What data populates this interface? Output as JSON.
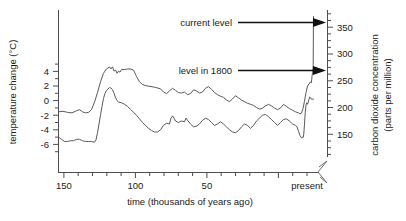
{
  "chart_data": {
    "type": "line",
    "title": "",
    "xlabel": "time (thousands of years ago)",
    "ylabel_left": "temperature change (°C)",
    "ylabel_right_line1": "carbon dioxide concentration",
    "ylabel_right_line2": "(parts per million)",
    "x_axis": {
      "tick_labels": [
        "150",
        "100",
        "50",
        "present"
      ],
      "tick_values": [
        150,
        100,
        50,
        0
      ],
      "minor_tick_values": [
        160,
        140,
        130,
        120,
        110,
        90,
        80,
        70,
        60,
        40,
        30,
        20,
        10
      ],
      "range": [
        170,
        -4
      ],
      "direction": "reversed",
      "units": "thousands of years ago"
    },
    "y_axis_left": {
      "tick_labels": [
        "4",
        "2",
        "0",
        "-2",
        "-4",
        "-6"
      ],
      "tick_values": [
        4,
        2,
        0,
        -2,
        -4,
        -6
      ],
      "minor_tick_values": [
        5,
        3,
        1,
        -1,
        -3,
        -5,
        -7
      ],
      "range": [
        -7.2,
        6.2
      ],
      "units": "°C"
    },
    "y_axis_right": {
      "tick_labels": [
        "350",
        "300",
        "250",
        "200",
        "150"
      ],
      "tick_values": [
        350,
        300,
        250,
        200,
        150
      ],
      "range": [
        120,
        380
      ],
      "units": "parts per million",
      "axis_break": true
    },
    "grid": false,
    "legend_position": "none",
    "annotations": [
      {
        "id": "current-level",
        "text": "current level",
        "points_to": "co2-curve-right-end",
        "value_ppm": 370
      },
      {
        "id": "level-1800",
        "text": "level in 1800",
        "points_to": "co2-curve-preindustrial",
        "value_ppm": 280
      }
    ],
    "series": [
      {
        "name": "carbon dioxide concentration",
        "axis": "right",
        "units": "ppm",
        "points": [
          [
            170,
            192
          ],
          [
            167,
            193
          ],
          [
            164,
            191
          ],
          [
            161,
            190
          ],
          [
            158,
            194
          ],
          [
            156,
            196
          ],
          [
            154,
            192
          ],
          [
            152,
            190
          ],
          [
            150,
            191
          ],
          [
            148,
            196
          ],
          [
            146,
            210
          ],
          [
            144,
            228
          ],
          [
            142,
            248
          ],
          [
            140,
            264
          ],
          [
            138,
            272
          ],
          [
            136,
            276
          ],
          [
            135,
            272
          ],
          [
            134,
            276
          ],
          [
            133,
            268
          ],
          [
            132,
            270
          ],
          [
            131,
            264
          ],
          [
            130,
            268
          ],
          [
            129,
            266
          ],
          [
            128,
            271
          ],
          [
            126,
            271
          ],
          [
            124,
            272
          ],
          [
            122,
            272
          ],
          [
            120,
            270
          ],
          [
            118,
            258
          ],
          [
            116,
            248
          ],
          [
            114,
            243
          ],
          [
            112,
            241
          ],
          [
            110,
            240
          ],
          [
            106,
            238
          ],
          [
            102,
            235
          ],
          [
            100,
            229
          ],
          [
            98,
            226
          ],
          [
            96,
            231
          ],
          [
            94,
            236
          ],
          [
            92,
            232
          ],
          [
            90,
            228
          ],
          [
            88,
            227
          ],
          [
            86,
            229
          ],
          [
            84,
            224
          ],
          [
            82,
            226
          ],
          [
            80,
            233
          ],
          [
            78,
            231
          ],
          [
            76,
            227
          ],
          [
            74,
            229
          ],
          [
            72,
            236
          ],
          [
            70,
            239
          ],
          [
            68,
            234
          ],
          [
            66,
            228
          ],
          [
            64,
            224
          ],
          [
            62,
            221
          ],
          [
            60,
            219
          ],
          [
            58,
            214
          ],
          [
            56,
            211
          ],
          [
            54,
            216
          ],
          [
            52,
            222
          ],
          [
            50,
            218
          ],
          [
            48,
            214
          ],
          [
            46,
            211
          ],
          [
            44,
            208
          ],
          [
            42,
            206
          ],
          [
            40,
            204
          ],
          [
            38,
            200
          ],
          [
            36,
            197
          ],
          [
            34,
            199
          ],
          [
            32,
            203
          ],
          [
            30,
            206
          ],
          [
            28,
            203
          ],
          [
            26,
            199
          ],
          [
            24,
            196
          ],
          [
            22,
            199
          ],
          [
            20,
            206
          ],
          [
            18,
            202
          ],
          [
            16,
            198
          ],
          [
            14,
            195
          ],
          [
            12,
            192
          ],
          [
            10,
            190
          ],
          [
            9,
            188
          ],
          [
            8,
            190
          ],
          [
            7,
            198
          ],
          [
            6,
            212
          ],
          [
            5,
            228
          ],
          [
            4,
            240
          ],
          [
            3,
            244
          ],
          [
            2,
            248
          ],
          [
            1.5,
            246
          ],
          [
            1.2,
            252
          ],
          [
            1.0,
            258
          ],
          [
            0.6,
            266
          ],
          [
            0.3,
            274
          ],
          [
            0.2,
            280
          ],
          [
            0.15,
            300
          ],
          [
            0.1,
            330
          ],
          [
            0.05,
            360
          ],
          [
            0.0,
            370
          ]
        ]
      },
      {
        "name": "temperature change",
        "axis": "left",
        "units": "°C",
        "points": [
          [
            170,
            -5.0
          ],
          [
            168,
            -5.3
          ],
          [
            166,
            -5.6
          ],
          [
            164,
            -5.6
          ],
          [
            162,
            -5.5
          ],
          [
            160,
            -5.5
          ],
          [
            158,
            -5.3
          ],
          [
            156,
            -5.3
          ],
          [
            154,
            -5.5
          ],
          [
            152,
            -5.6
          ],
          [
            150,
            -5.6
          ],
          [
            148,
            -5.6
          ],
          [
            146,
            -5.7
          ],
          [
            145,
            -5.4
          ],
          [
            144,
            -4.4
          ],
          [
            143,
            -3.2
          ],
          [
            142,
            -2.0
          ],
          [
            141,
            -0.8
          ],
          [
            140,
            0.3
          ],
          [
            139,
            1.0
          ],
          [
            138,
            1.4
          ],
          [
            137,
            1.6
          ],
          [
            136,
            1.8
          ],
          [
            135,
            1.7
          ],
          [
            134,
            1.5
          ],
          [
            133,
            1.0
          ],
          [
            132,
            0.4
          ],
          [
            131,
            0.0
          ],
          [
            130,
            -0.2
          ],
          [
            128,
            -0.3
          ],
          [
            126,
            -0.5
          ],
          [
            124,
            -0.8
          ],
          [
            122,
            -1.2
          ],
          [
            120,
            -1.6
          ],
          [
            118,
            -2.0
          ],
          [
            116,
            -2.5
          ],
          [
            114,
            -3.0
          ],
          [
            112,
            -3.4
          ],
          [
            110,
            -3.8
          ],
          [
            108,
            -4.1
          ],
          [
            106,
            -4.3
          ],
          [
            104,
            -4.3
          ],
          [
            102,
            -4.0
          ],
          [
            100,
            -3.4
          ],
          [
            98,
            -3.1
          ],
          [
            96,
            -3.2
          ],
          [
            95,
            -2.4
          ],
          [
            94,
            -2.1
          ],
          [
            93,
            -2.4
          ],
          [
            92,
            -2.8
          ],
          [
            90,
            -3.0
          ],
          [
            88,
            -2.8
          ],
          [
            86,
            -2.9
          ],
          [
            85,
            -2.4
          ],
          [
            84,
            -2.7
          ],
          [
            82,
            -3.2
          ],
          [
            80,
            -3.6
          ],
          [
            78,
            -3.5
          ],
          [
            76,
            -3.2
          ],
          [
            74,
            -2.7
          ],
          [
            72,
            -2.4
          ],
          [
            70,
            -2.6
          ],
          [
            68,
            -3.0
          ],
          [
            66,
            -3.4
          ],
          [
            64,
            -3.2
          ],
          [
            62,
            -2.9
          ],
          [
            60,
            -3.2
          ],
          [
            58,
            -3.6
          ],
          [
            56,
            -4.0
          ],
          [
            54,
            -4.3
          ],
          [
            52,
            -4.4
          ],
          [
            50,
            -4.1
          ],
          [
            48,
            -3.6
          ],
          [
            46,
            -3.2
          ],
          [
            44,
            -3.4
          ],
          [
            42,
            -3.8
          ],
          [
            40,
            -3.4
          ],
          [
            38,
            -2.8
          ],
          [
            36,
            -2.4
          ],
          [
            34,
            -2.0
          ],
          [
            32,
            -1.9
          ],
          [
            30,
            -2.2
          ],
          [
            28,
            -2.6
          ],
          [
            26,
            -3.0
          ],
          [
            24,
            -3.4
          ],
          [
            22,
            -3.0
          ],
          [
            20,
            -2.6
          ],
          [
            18,
            -2.5
          ],
          [
            16,
            -2.8
          ],
          [
            14,
            -3.2
          ],
          [
            12,
            -3.4
          ],
          [
            11,
            -3.6
          ],
          [
            10,
            -4.2
          ],
          [
            9,
            -4.8
          ],
          [
            8,
            -5.1
          ],
          [
            7.5,
            -5.0
          ],
          [
            7,
            -5.1
          ],
          [
            6.5,
            -4.6
          ],
          [
            6,
            -3.2
          ],
          [
            5.5,
            -1.6
          ],
          [
            5,
            -0.6
          ],
          [
            4.5,
            -0.3
          ],
          [
            4,
            -0.5
          ],
          [
            3.5,
            -0.2
          ],
          [
            3,
            0.2
          ],
          [
            2.5,
            0.5
          ],
          [
            2,
            0.4
          ],
          [
            1.5,
            0.2
          ],
          [
            1,
            0.2
          ],
          [
            0.5,
            0.2
          ],
          [
            0,
            0.2
          ]
        ]
      }
    ]
  },
  "colors": {
    "curve": "#5a5a5a",
    "axis": "#4d4d4d",
    "text": "#1a1a1a",
    "arrow": "#111111",
    "background": "#ffffff"
  }
}
